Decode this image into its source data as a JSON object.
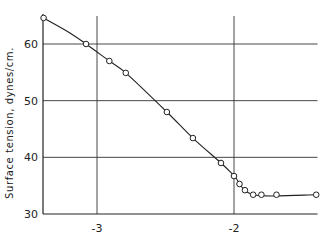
{
  "chart_data": {
    "type": "line",
    "title": "",
    "xlabel": "",
    "ylabel": "Surface tension, dynes/cm.",
    "xlim": [
      -3.39,
      -1.38
    ],
    "ylim": [
      30,
      66
    ],
    "grid": true,
    "x_ticks": [
      -3,
      -2
    ],
    "x_tick_labels": [
      "-3",
      "-2"
    ],
    "y_ticks": [
      30,
      40,
      50,
      60
    ],
    "y_tick_labels": [
      "30",
      "40",
      "50",
      "60"
    ],
    "series": [
      {
        "name": "surface tension",
        "markers": "open-circle",
        "points": [
          {
            "x": -3.39,
            "y": 64.6
          },
          {
            "x": -3.08,
            "y": 60.0
          },
          {
            "x": -2.91,
            "y": 57.0
          },
          {
            "x": -2.79,
            "y": 54.9
          },
          {
            "x": -2.49,
            "y": 48.0
          },
          {
            "x": -2.3,
            "y": 43.4
          },
          {
            "x": -2.095,
            "y": 39.0
          },
          {
            "x": -2.0,
            "y": 36.7
          },
          {
            "x": -1.96,
            "y": 35.3
          },
          {
            "x": -1.92,
            "y": 34.2
          },
          {
            "x": -1.86,
            "y": 33.4
          },
          {
            "x": -1.8,
            "y": 33.4
          },
          {
            "x": -1.69,
            "y": 33.4
          },
          {
            "x": -1.4,
            "y": 33.4
          }
        ],
        "curve": [
          {
            "x": -3.39,
            "y": 64.6
          },
          {
            "x": -3.2,
            "y": 62.0
          },
          {
            "x": -3.08,
            "y": 60.0
          },
          {
            "x": -2.91,
            "y": 57.0
          },
          {
            "x": -2.79,
            "y": 54.9
          },
          {
            "x": -2.49,
            "y": 48.0
          },
          {
            "x": -2.3,
            "y": 43.4
          },
          {
            "x": -2.095,
            "y": 39.0
          },
          {
            "x": -2.0,
            "y": 36.8
          },
          {
            "x": -1.86,
            "y": 33.4
          },
          {
            "x": -1.4,
            "y": 33.4
          }
        ]
      }
    ]
  }
}
